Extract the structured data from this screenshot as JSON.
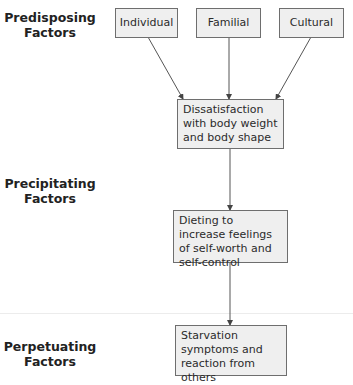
{
  "diagram": {
    "type": "flowchart",
    "row_labels": [
      {
        "id": "predisposing",
        "line1": "Predisposing",
        "line2": "Factors"
      },
      {
        "id": "precipitating",
        "line1": "Precipitating",
        "line2": "Factors"
      },
      {
        "id": "perpetuating",
        "line1": "Perpetuating",
        "line2": "Factors"
      }
    ],
    "nodes": {
      "individual": "Individual",
      "familial": "Familial",
      "cultural": "Cultural",
      "dissatisfaction": "Dissatisfaction with body weight and body shape",
      "dieting": "Dieting to increase feelings of self-worth and self-control",
      "starvation": "Starvation symptoms and reaction from others"
    },
    "edges": [
      [
        "individual",
        "dissatisfaction"
      ],
      [
        "familial",
        "dissatisfaction"
      ],
      [
        "cultural",
        "dissatisfaction"
      ],
      [
        "dissatisfaction",
        "dieting"
      ],
      [
        "dieting",
        "starvation"
      ]
    ],
    "colors": {
      "box_fill": "#efefef",
      "box_border": "#6e6e6e",
      "line": "#444444"
    }
  }
}
